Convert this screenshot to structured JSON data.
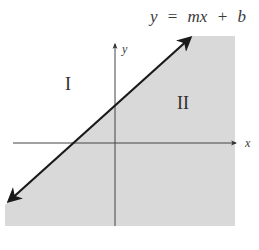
{
  "diagram": {
    "type": "linear-inequality-regions",
    "equation": {
      "lhs": "y",
      "eq": "=",
      "slope_term": "mx",
      "plus": "+",
      "intercept": "b"
    },
    "axes": {
      "x_label": "x",
      "y_label": "y"
    },
    "regions": [
      {
        "label": "I",
        "side": "above line",
        "shaded": false
      },
      {
        "label": "II",
        "side": "below line",
        "shaded": true
      }
    ],
    "line": {
      "description": "line y = mx + b with arrows at both ends",
      "slope_sign": "positive"
    },
    "colors": {
      "shade": "#d9d9d9",
      "line": "#1a1a1a",
      "axis": "#555555",
      "text": "#333333"
    }
  }
}
